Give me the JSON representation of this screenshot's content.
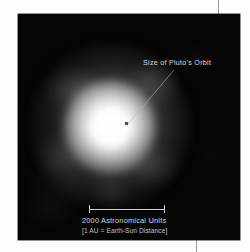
{
  "figure": {
    "type": "astronomical-image",
    "medium": "grayscale telescope image on black field",
    "subject_glow": "diffuse nebular halo"
  },
  "annotations": {
    "orbit_label": "Size of Pluto's Orbit",
    "orbit_marker": "orbit-scale-dot",
    "leader_line": "leader-line"
  },
  "scale": {
    "caption_primary": "2000 Astronomical Units",
    "caption_secondary": "[1 AU = Earth-Sun Distance]",
    "bar_value": 2000,
    "bar_unit": "Astronomical Units"
  },
  "colors": {
    "page_background": "#fdfdfd",
    "panel_background": "#050505",
    "glow": "#ffffff",
    "label_text": "#d8d8d8",
    "caption_text": "#d6d6d6",
    "scale_bar": "#cfcfcf",
    "crop_rule": "#9a9a9a",
    "marker_dot": "#4a4a4a"
  }
}
